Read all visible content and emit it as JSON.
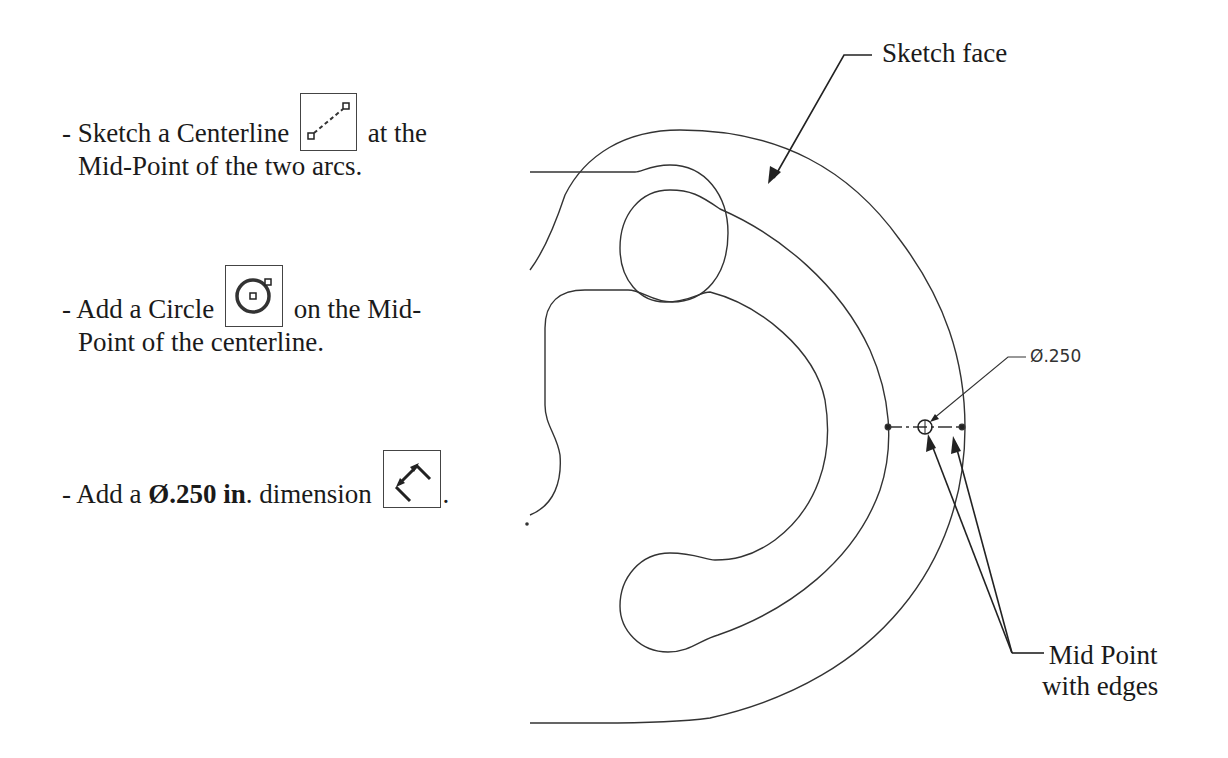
{
  "instructions": {
    "step1": {
      "prefix": "- Sketch a Centerline",
      "suffix": "at the",
      "line2": "Mid-Point of the two arcs.",
      "icon": "centerline-tool-icon"
    },
    "step2": {
      "prefix": "- Add a Circle",
      "suffix": "on the Mid-",
      "line2": "Point of the centerline.",
      "icon": "circle-tool-icon"
    },
    "step3": {
      "prefix": "- Add a ",
      "bold": "Ø.250 in",
      "middle": ". dimension",
      "suffix": ".",
      "icon": "smart-dimension-tool-icon"
    }
  },
  "callouts": {
    "sketch_face": "Sketch face",
    "mid_point_line1": "Mid Point",
    "mid_point_line2": "with edges"
  },
  "dimension": {
    "label": "Ø.250"
  },
  "colors": {
    "line": "#333333",
    "text": "#1a1a1a",
    "background": "#ffffff"
  }
}
